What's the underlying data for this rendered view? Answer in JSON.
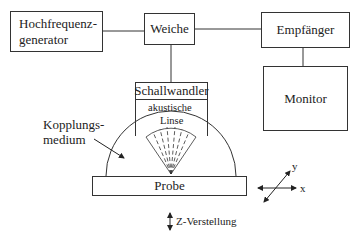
{
  "diagram": {
    "type": "block-diagram",
    "title": "",
    "blocks": {
      "generator": {
        "line1": "Hochfrequenz-",
        "line2": "generator"
      },
      "weiche": {
        "label": "Weiche"
      },
      "receiver": {
        "label": "Empfänger"
      },
      "monitor": {
        "label": "Monitor"
      },
      "transducer": {
        "label": "Schallwandler",
        "lens_line1": "akustische",
        "lens_line2": "Linse"
      },
      "sample": {
        "label": "Probe"
      }
    },
    "annotations": {
      "coupling_line1": "Kopplungs-",
      "coupling_line2": "medium",
      "z_adjust": "Z-Verstellung",
      "axis_x": "x",
      "axis_y": "y"
    },
    "connections": [
      {
        "from": "Hochfrequenzgenerator",
        "to": "Weiche"
      },
      {
        "from": "Weiche",
        "to": "Empfänger"
      },
      {
        "from": "Weiche",
        "to": "Schallwandler"
      },
      {
        "from": "Empfänger",
        "to": "Monitor"
      }
    ]
  }
}
